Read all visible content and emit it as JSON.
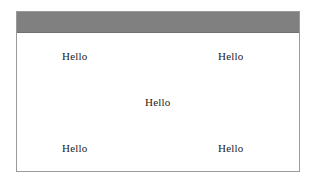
{
  "window": {
    "title_bar": {
      "title": "",
      "background_color": "#808080",
      "has_buttons": false
    },
    "frame": {
      "border_color": "#9a9a9a",
      "background_color": "#ffffff"
    }
  },
  "content": {
    "text_color": "#1c1c1c",
    "labels": [
      {
        "id": "top-left",
        "text": "Hello",
        "row": 1,
        "column": 1
      },
      {
        "id": "top-right",
        "text": "Hello",
        "row": 1,
        "column": 3
      },
      {
        "id": "center",
        "text": "Hello",
        "row": 2,
        "column": 2
      },
      {
        "id": "bottom-left",
        "text": "Hello",
        "row": 3,
        "column": 1
      },
      {
        "id": "bottom-right",
        "text": "Hello",
        "row": 3,
        "column": 3
      }
    ]
  }
}
